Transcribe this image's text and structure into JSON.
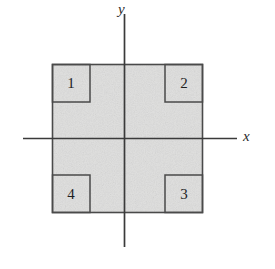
{
  "figure": {
    "axes": {
      "x_label": "x",
      "y_label": "y",
      "origin": {
        "x": 124,
        "y": 138
      },
      "x_axis_extent": [
        23,
        237
      ],
      "y_axis_extent": [
        14,
        247
      ],
      "line_color": "#3a3a3a"
    },
    "square": {
      "left": 52,
      "top": 64,
      "right": 203,
      "bottom": 213,
      "fill_color": "#e4e4e4",
      "stroke_color": "#4a4a4a"
    },
    "corner_cells": [
      {
        "label": "1",
        "position": "top-left",
        "left": 52,
        "top": 64,
        "width": 38,
        "height": 38
      },
      {
        "label": "2",
        "position": "top-right",
        "left": 165,
        "top": 64,
        "width": 38,
        "height": 38
      },
      {
        "label": "3",
        "position": "bottom-right",
        "left": 165,
        "top": 175,
        "width": 38,
        "height": 38
      },
      {
        "label": "4",
        "position": "bottom-left",
        "left": 52,
        "top": 175,
        "width": 38,
        "height": 38
      }
    ]
  }
}
